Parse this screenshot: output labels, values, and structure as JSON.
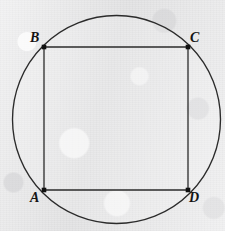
{
  "figure": {
    "canvas": {
      "width": 225,
      "height": 231
    },
    "background_color": "#ebebeb",
    "stroke_color": "#2b2b2b",
    "label_color": "#141414",
    "circle": {
      "name": "circumscribed-circle",
      "center_x": 116.5,
      "center_y": 119.5,
      "radius": 104,
      "stroke_width": 1.35
    },
    "square": {
      "name": "inscribed-square",
      "stroke_width": 1.3,
      "side_length": 144,
      "points": "44,47 188,47 188,190 44,190"
    },
    "vertices": [
      {
        "id": "B",
        "label": "B",
        "x": 44,
        "y": 47,
        "label_x": 30,
        "label_y": 31
      },
      {
        "id": "C",
        "label": "C",
        "x": 188,
        "y": 47,
        "label_x": 190,
        "label_y": 31
      },
      {
        "id": "A",
        "label": "A",
        "x": 44,
        "y": 190,
        "label_x": 30,
        "label_y": 191
      },
      {
        "id": "D",
        "label": "D",
        "x": 188,
        "y": 190,
        "label_x": 189,
        "label_y": 191
      }
    ],
    "vertex_dot": {
      "name": "vertex-marker",
      "size": 4.6,
      "fill": "#111111"
    }
  }
}
